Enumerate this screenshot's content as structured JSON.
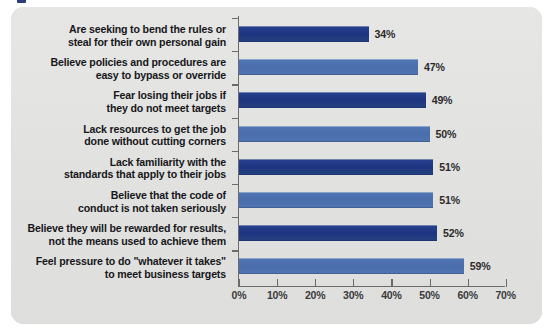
{
  "chart_data": {
    "type": "bar",
    "orientation": "horizontal",
    "title": "",
    "subtitle": "",
    "xlabel": "",
    "ylabel": "",
    "xlim": [
      0,
      70
    ],
    "xticks": [
      0,
      10,
      20,
      30,
      40,
      50,
      60,
      70
    ],
    "xticklabels": [
      "0%",
      "10%",
      "20%",
      "30%",
      "40%",
      "50%",
      "60%",
      "70%"
    ],
    "grid": false,
    "legend": false,
    "value_suffix": "%",
    "categories": [
      "Are seeking to bend the rules or\nsteal for their own personal gain",
      "Believe policies and procedures are\neasy to bypass or override",
      "Fear losing their jobs if\nthey do not meet targets",
      "Lack resources to get the job\ndone without cutting corners",
      "Lack familiarity with the\nstandards that apply to their jobs",
      "Believe that the code of\nconduct is not taken seriously",
      "Believe they will be rewarded for results,\nnot the means used to achieve them",
      "Feel pressure to do \"whatever it takes\"\nto meet business targets"
    ],
    "values": [
      34,
      47,
      49,
      50,
      51,
      51,
      52,
      59
    ],
    "value_labels": [
      "34%",
      "47%",
      "49%",
      "50%",
      "51%",
      "51%",
      "52%",
      "59%"
    ],
    "bar_colors": [
      "#1d3480",
      "#4a6dac",
      "#1d3480",
      "#4a6dac",
      "#1d3480",
      "#4a6dac",
      "#1d3480",
      "#4a6dac"
    ]
  },
  "style": {
    "panel_background": "#e3e3e2",
    "page_background": "#ffffff",
    "axis_color": "#6b6b6b",
    "label_color": "#17171a",
    "value_color": "#2b2b2b",
    "accent_dark": "#1d3480",
    "accent_light": "#4a6dac"
  }
}
